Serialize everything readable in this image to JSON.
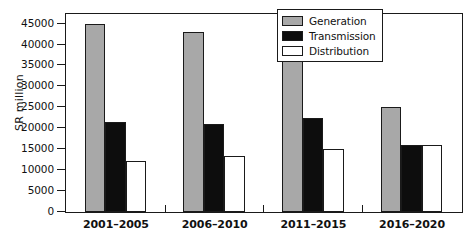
{
  "chart_data": {
    "type": "bar",
    "title": "",
    "xlabel": "",
    "ylabel": "SR million",
    "categories": [
      "2001–2005",
      "2006–2010",
      "2011–2015",
      "2016–2020"
    ],
    "series": [
      {
        "name": "Generation",
        "color": "#a8a8a8",
        "values": [
          45000,
          43000,
          46000,
          25000
        ]
      },
      {
        "name": "Transmission",
        "color": "#0d0d0d",
        "values": [
          21500,
          21000,
          22500,
          16000
        ]
      },
      {
        "name": "Distribution",
        "color": "#ffffff",
        "values": [
          12200,
          13300,
          15000,
          16100
        ]
      }
    ],
    "ylim": [
      0,
      47000
    ],
    "yticks": [
      0,
      5000,
      10000,
      15000,
      20000,
      25000,
      30000,
      35000,
      40000,
      45000
    ],
    "ytick_labels": [
      "0",
      "5000",
      "10000",
      "15000",
      "20000",
      "25000",
      "30000",
      "35000",
      "40000",
      "45000"
    ],
    "grid": false,
    "legend_position": "top-right",
    "frame": true
  },
  "legend": {
    "items": [
      {
        "label": "Generation"
      },
      {
        "label": "Transmission"
      },
      {
        "label": "Distribution"
      }
    ]
  }
}
